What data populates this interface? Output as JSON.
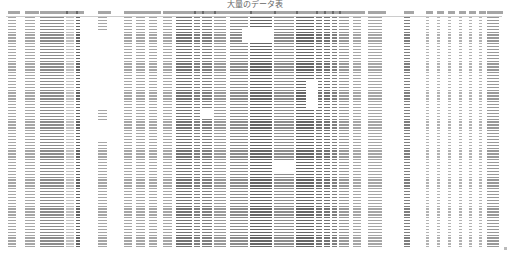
{
  "title": "大量のデータ表",
  "sheet": {
    "headers": [
      "",
      "",
      "",
      "",
      "",
      "",
      "",
      "",
      "",
      "",
      "",
      "",
      "",
      "",
      "",
      "",
      "",
      "",
      "",
      "",
      "",
      "",
      "",
      "",
      "",
      "",
      "",
      "",
      "",
      "",
      "",
      "",
      ""
    ],
    "row_count_approx": 80,
    "note_text_legibility": "cell text too small to read at source resolution"
  },
  "columns": [
    {
      "x": 2,
      "w": 8,
      "a": 0.35
    },
    {
      "x": 19,
      "w": 10,
      "a": 0.35
    },
    {
      "x": 34,
      "w": 24,
      "a": 0.45
    },
    {
      "x": 60,
      "w": 8,
      "a": 0.25
    },
    {
      "x": 70,
      "w": 4,
      "a": 0.6
    },
    {
      "x": 92,
      "w": 9,
      "a": 0.35
    },
    {
      "x": 118,
      "w": 8,
      "a": 0.35
    },
    {
      "x": 130,
      "w": 9,
      "a": 0.35
    },
    {
      "x": 143,
      "w": 8,
      "a": 0.35
    },
    {
      "x": 157,
      "w": 9,
      "a": 0.35
    },
    {
      "x": 170,
      "w": 16,
      "a": 0.55
    },
    {
      "x": 188,
      "w": 6,
      "a": 0.5
    },
    {
      "x": 196,
      "w": 10,
      "a": 0.5
    },
    {
      "x": 208,
      "w": 12,
      "a": 0.4
    },
    {
      "x": 224,
      "w": 18,
      "a": 0.45
    },
    {
      "x": 244,
      "w": 22,
      "a": 0.6
    },
    {
      "x": 268,
      "w": 20,
      "a": 0.45
    },
    {
      "x": 290,
      "w": 18,
      "a": 0.6
    },
    {
      "x": 310,
      "w": 6,
      "a": 0.55
    },
    {
      "x": 318,
      "w": 6,
      "a": 0.55
    },
    {
      "x": 326,
      "w": 5,
      "a": 0.5
    },
    {
      "x": 333,
      "w": 10,
      "a": 0.4
    },
    {
      "x": 347,
      "w": 8,
      "a": 0.35
    },
    {
      "x": 362,
      "w": 14,
      "a": 0.35
    },
    {
      "x": 398,
      "w": 6,
      "a": 0.5
    },
    {
      "x": 420,
      "w": 3,
      "a": 0.3
    },
    {
      "x": 431,
      "w": 3,
      "a": 0.3
    },
    {
      "x": 442,
      "w": 3,
      "a": 0.3
    },
    {
      "x": 453,
      "w": 3,
      "a": 0.3
    },
    {
      "x": 463,
      "w": 3,
      "a": 0.3
    },
    {
      "x": 473,
      "w": 3,
      "a": 0.3
    },
    {
      "x": 481,
      "w": 12,
      "a": 0.4
    }
  ],
  "blanks": [
    {
      "x": 236,
      "y": 18,
      "w": 30,
      "h": 14
    },
    {
      "x": 196,
      "y": 100,
      "w": 10,
      "h": 8
    },
    {
      "x": 300,
      "y": 70,
      "w": 12,
      "h": 28
    },
    {
      "x": 268,
      "y": 150,
      "w": 20,
      "h": 12
    },
    {
      "x": 92,
      "y": 20,
      "w": 9,
      "h": 80
    },
    {
      "x": 92,
      "y": 110,
      "w": 9,
      "h": 20
    }
  ]
}
